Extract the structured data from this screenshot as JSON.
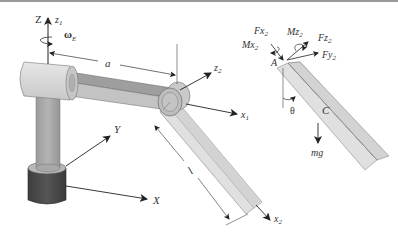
{
  "figure": {
    "labels": {
      "Z": "Z",
      "z1": "z",
      "z1_sub": "1",
      "omega": "ω",
      "omega_sub": "E",
      "a": "a",
      "z2": "z",
      "z2_sub": "2",
      "x1": "x",
      "x1_sub": "1",
      "x2": "x",
      "x2_sub": "2",
      "l": "l",
      "Y": "Y",
      "X": "X",
      "Fx2": "Fx",
      "Fx2_sub": "2",
      "Mx2": "Mx",
      "Mx2_sub": "2",
      "Mz2": "Mz",
      "Mz2_sub": "2",
      "Fz2": "Fz",
      "Fz2_sub": "2",
      "Fy2": "Fy",
      "Fy2_sub": "2",
      "A": "A",
      "theta": "θ",
      "C": "C",
      "mg": "mg"
    },
    "colors": {
      "light_metal": "#d8d8d8",
      "mid_metal": "#a9a9a9",
      "dark_metal": "#4a4a4a",
      "rod_light": "#e2e2e2",
      "rod_mid": "#cfcfcf",
      "line": "#333333",
      "border": "#9a9a9a"
    }
  }
}
